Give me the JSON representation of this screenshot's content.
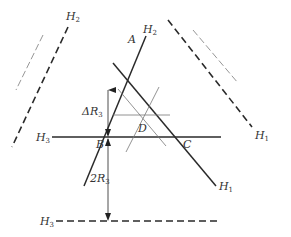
{
  "diagram": {
    "type": "geometric-construction",
    "labels": {
      "H2_top_left": {
        "main": "H",
        "sub": "2"
      },
      "H2_inner": {
        "main": "H",
        "sub": "2"
      },
      "H1_right": {
        "main": "H",
        "sub": "1"
      },
      "H1_inner": {
        "main": "H",
        "sub": "1"
      },
      "H3_left": {
        "main": "H",
        "sub": "3"
      },
      "H3_bottom": {
        "main": "H",
        "sub": "3"
      },
      "point_A": "A",
      "point_B": "B",
      "point_C": "C",
      "point_D": "D",
      "delta_R3": {
        "main": "ΔR",
        "sub": "3"
      },
      "two_R3": {
        "main": "2R",
        "sub": "3"
      }
    },
    "colors": {
      "solid_line": "#2a2a2a",
      "thin_line": "#777777",
      "dashed_light": "#8a8a8a"
    }
  }
}
